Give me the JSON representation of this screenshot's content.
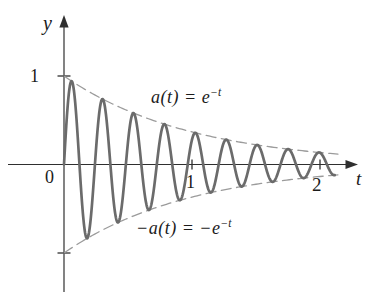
{
  "figure": {
    "background": "#ffffff"
  },
  "chart_data": {
    "type": "line",
    "title": "",
    "xlabel": "t",
    "ylabel": "y",
    "origin_label": "0",
    "xlim": [
      -0.45,
      2.35
    ],
    "ylim": [
      -1.5,
      1.7
    ],
    "grid": false,
    "axis_color": "#2f2f2f",
    "label_color": "#1b1b1b",
    "x_ticks": [
      {
        "value": 1,
        "label": "1"
      },
      {
        "value": 2,
        "label": "2"
      }
    ],
    "y_ticks": [
      {
        "value": 1,
        "label": "1"
      },
      {
        "value": -1,
        "label": ""
      }
    ],
    "series": [
      {
        "name": "upper-envelope",
        "formula": "a(t) = e^(-t)",
        "sign": 1,
        "decay_rate": 1,
        "t_domain": [
          0,
          2.15
        ],
        "line_style": "dashed",
        "color": "#9b9b9b",
        "stroke_width": 1.3
      },
      {
        "name": "lower-envelope",
        "formula": "-a(t) = -e^(-t)",
        "sign": -1,
        "decay_rate": 1,
        "t_domain": [
          0,
          2.15
        ],
        "line_style": "dashed",
        "color": "#9b9b9b",
        "stroke_width": 1.3
      },
      {
        "name": "damped-oscillation",
        "formula": "y = e^(-t) * sin(26t)",
        "decay_rate": 1,
        "angular_frequency": 26,
        "t_domain": [
          0,
          2.115
        ],
        "line_style": "solid",
        "color": "#6b6b6b",
        "stroke_width": 2.7
      }
    ],
    "annotations": [
      {
        "name": "upper-envelope-label",
        "base": "a(t) = e",
        "exp": "−t",
        "position": {
          "t": 1.06,
          "y": 0.73
        }
      },
      {
        "name": "lower-envelope-label",
        "base": "−a(t) = −e",
        "exp": "−t",
        "position": {
          "t": 1.04,
          "y": -0.75
        }
      }
    ]
  }
}
